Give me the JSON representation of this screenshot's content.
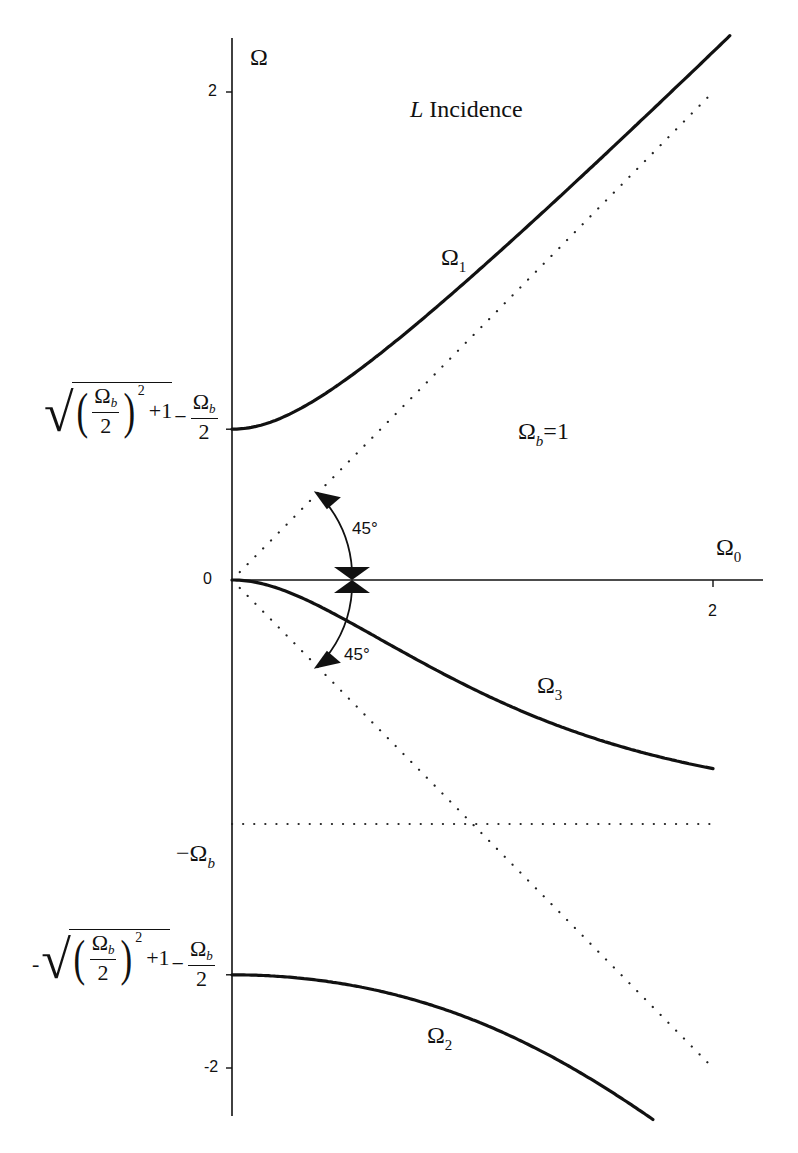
{
  "chart_data": {
    "type": "line",
    "title": "L Incidence",
    "title_italic_part": "L",
    "title_rest": " Incidence",
    "xlabel": "Ω",
    "xlabel_sub": "0",
    "ylabel": "Ω",
    "xlim": [
      0,
      2.2
    ],
    "ylim": [
      -2.2,
      2.3
    ],
    "grid": false,
    "parameter": {
      "name": "Ω_b",
      "value": 1,
      "label_main": "Ω",
      "label_sub": "b",
      "label_rest": "=1"
    },
    "x_ticks": [
      {
        "value": 2,
        "label": "2"
      }
    ],
    "y_ticks": [
      {
        "value": 2,
        "label": "2"
      },
      {
        "value": 0,
        "label": "0"
      },
      {
        "value": -2,
        "label": "-2"
      }
    ],
    "y_annotations": [
      {
        "value": 0.618,
        "label": "√((Ω_b/2)^2+1) − Ω_b/2"
      },
      {
        "value": -1.0,
        "label": "−Ω_b"
      },
      {
        "value": -1.618,
        "label": "−√((Ω_b/2)^2+1) − Ω_b/2"
      }
    ],
    "series": [
      {
        "name": "Ω1",
        "label_main": "Ω",
        "label_sub": "1",
        "style": "solid",
        "x": [
          0,
          0.25,
          0.5,
          0.75,
          1.0,
          1.25,
          1.5,
          1.75,
          2.0,
          2.07
        ],
        "y": [
          0.618,
          0.68,
          0.84,
          1.05,
          1.28,
          1.52,
          1.76,
          2.01,
          2.26,
          2.33
        ]
      },
      {
        "name": "Ω3",
        "label_main": "Ω",
        "label_sub": "3",
        "style": "solid",
        "x": [
          0,
          0.25,
          0.5,
          0.75,
          1.0,
          1.25,
          1.5,
          1.75,
          2.0
        ],
        "y": [
          0,
          -0.06,
          -0.2,
          -0.36,
          -0.5,
          -0.6,
          -0.67,
          -0.73,
          -0.77
        ]
      },
      {
        "name": "Ω2",
        "label_main": "Ω",
        "label_sub": "2",
        "style": "solid",
        "x": [
          0,
          0.25,
          0.5,
          0.75,
          1.0,
          1.25,
          1.5,
          1.75
        ],
        "y": [
          -1.618,
          -1.63,
          -1.66,
          -1.72,
          -1.8,
          -1.9,
          -2.03,
          -2.18
        ]
      },
      {
        "name": "Ω = Ω0",
        "style": "dotted",
        "x": [
          0,
          2
        ],
        "y": [
          0,
          2
        ]
      },
      {
        "name": "Ω = −Ω0",
        "style": "dotted",
        "x": [
          0,
          2
        ],
        "y": [
          0,
          -2
        ]
      },
      {
        "name": "Ω = −Ω_b",
        "style": "dotted",
        "x": [
          0,
          2
        ],
        "y": [
          -1,
          -1
        ]
      }
    ],
    "annotations": [
      {
        "text": "45°",
        "position": "upper",
        "desc": "angle arc between Ω0 axis and line Ω=Ω0"
      },
      {
        "text": "45°",
        "position": "lower",
        "desc": "angle arc between Ω0 axis and line Ω=−Ω0"
      }
    ]
  },
  "labels": {
    "y_axis": "Ω",
    "x_axis_main": "Ω",
    "x_axis_sub": "0",
    "title_italic": "L",
    "title_rest": " Incidence",
    "param_main": "Ω",
    "param_sub": "b",
    "param_rest": "=1",
    "omega1_main": "Ω",
    "omega1_sub": "1",
    "omega2_main": "Ω",
    "omega2_sub": "2",
    "omega3_main": "Ω",
    "omega3_sub": "3",
    "angle_upper": "45°",
    "angle_lower": "45°",
    "tick_y_2": "2",
    "tick_y_0": "0",
    "tick_y_m2": "-2",
    "tick_x_2": "2",
    "neg_omega_b_minus": "−Ω",
    "neg_omega_b_sub": "b",
    "formula": {
      "omega": "Ω",
      "b": "b",
      "two": "2",
      "sq": "2",
      "plus1": "+1",
      "minus": "−",
      "neg": "-"
    }
  }
}
